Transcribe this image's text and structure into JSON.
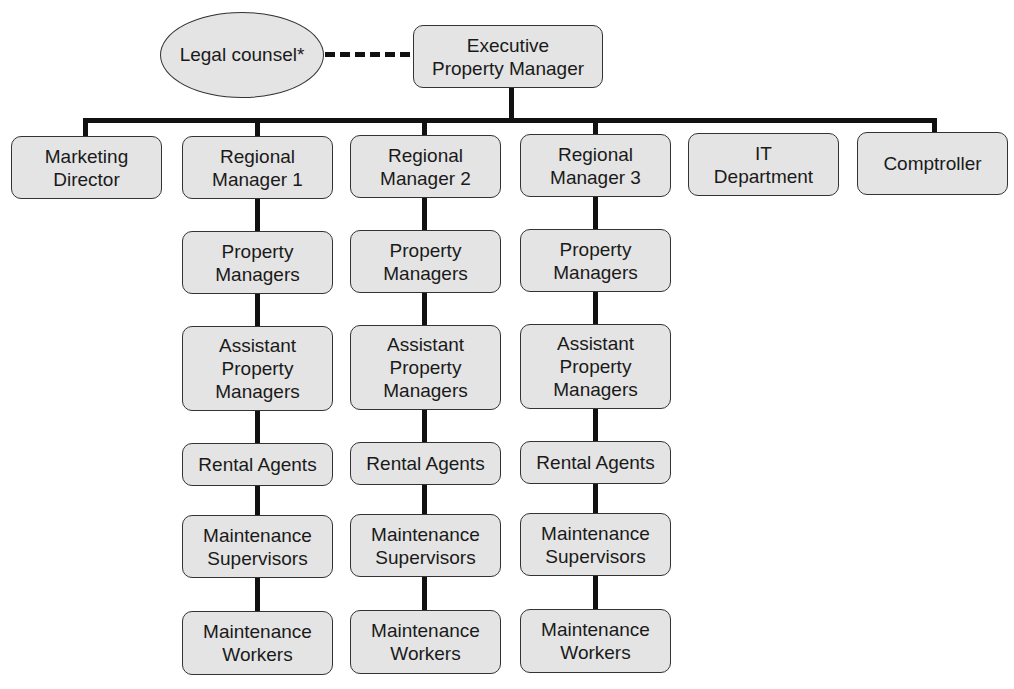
{
  "diagram": {
    "type": "org-chart",
    "advisor": {
      "label": "Legal counsel*",
      "relation": "dotted-line to Executive Property Manager"
    },
    "root": {
      "label": "Executive\nProperty Manager"
    },
    "top_level": [
      {
        "label": "Marketing\nDirector"
      },
      {
        "label": "Regional\nManager 1"
      },
      {
        "label": "Regional\nManager 2"
      },
      {
        "label": "Regional\nManager 3"
      },
      {
        "label": "IT\nDepartment"
      },
      {
        "label": "Comptroller"
      }
    ],
    "regional_chain": [
      {
        "label": "Property\nManagers"
      },
      {
        "label": "Assistant\nProperty\nManagers"
      },
      {
        "label": "Rental Agents"
      },
      {
        "label": "Maintenance\nSupervisors"
      },
      {
        "label": "Maintenance\nWorkers"
      }
    ],
    "colors": {
      "box_fill": "#e4e4e4",
      "border": "#333333",
      "connector": "#111111"
    }
  }
}
